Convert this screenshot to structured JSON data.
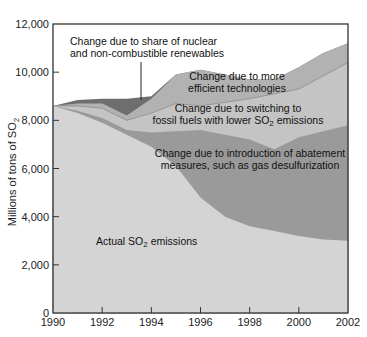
{
  "chart_data": {
    "type": "area",
    "stacked": true,
    "title": "",
    "xlabel": "",
    "ylabel": "Millions of tons of SO2",
    "xlim": [
      1990,
      2002
    ],
    "ylim": [
      0,
      12000
    ],
    "x_ticks": [
      1990,
      1992,
      1994,
      1996,
      1998,
      2000,
      2002
    ],
    "y_ticks": [
      0,
      2000,
      4000,
      6000,
      8000,
      10000,
      12000
    ],
    "y_tick_labels": [
      "0",
      "2,000",
      "4,000",
      "6,000",
      "8,000",
      "10,000",
      "12,000"
    ],
    "x_tick_labels": [
      "1990",
      "1992",
      "1994",
      "1996",
      "1998",
      "2000",
      "2002"
    ],
    "grid": false,
    "x": [
      1990,
      1991,
      1992,
      1993,
      1994,
      1995,
      1996,
      1997,
      1998,
      1999,
      2000,
      2001,
      2002
    ],
    "series": [
      {
        "name": "Actual SO2 emissions",
        "color": "#d4d4d4",
        "cumulative_top": [
          8600,
          8300,
          7900,
          7400,
          6900,
          6100,
          4800,
          4000,
          3600,
          3400,
          3200,
          3050,
          3000
        ]
      },
      {
        "name": "Change due to introduction of abatement measures, such as gas desulfurization",
        "color": "#9a9a9a",
        "cumulative_top": [
          8600,
          8400,
          8100,
          7600,
          7500,
          7550,
          7600,
          7400,
          7200,
          6800,
          7300,
          7550,
          7800
        ]
      },
      {
        "name": "Change due to switching to fossil fuels with lower SO2 emissions",
        "color": "#c4c4c4",
        "cumulative_top": [
          8600,
          8600,
          8500,
          8000,
          8300,
          8700,
          8600,
          8750,
          8900,
          9100,
          9300,
          9850,
          10400
        ]
      },
      {
        "name": "Change due to more efficient technologies",
        "color": "#b2b2b2",
        "cumulative_top": [
          8600,
          8700,
          8700,
          8200,
          8900,
          9900,
          10100,
          9900,
          9700,
          9700,
          10200,
          10800,
          11200
        ]
      },
      {
        "name": "Change due to share of nuclear and non-combustible renewables",
        "color": "#6e6e6e",
        "cumulative_top": [
          8600,
          8850,
          8900,
          8900,
          9000,
          9900,
          10100,
          9900,
          9700,
          9700,
          10200,
          10800,
          11200
        ]
      }
    ],
    "annotations": [
      {
        "text_lines": [
          "Change due to share of nuclear",
          "and non-combustible renewables"
        ],
        "x": 1993.6,
        "y": 11200,
        "leader_line_to": [
          1993.6,
          8800
        ]
      },
      {
        "text_lines": [
          "Change due to more",
          "efficient technologies"
        ],
        "x": 1998.2,
        "y": 9800
      },
      {
        "text_lines": [
          "Change due to switching to",
          "fossil fuels with lower SO2 emissions"
        ],
        "x": 1998.2,
        "y": 8700
      },
      {
        "text_lines": [
          "Change due to introduction of abatement",
          "measures, such as gas desulfurization"
        ],
        "x": 1998.6,
        "y": 7200
      },
      {
        "text_lines": [
          "Actual SO2 emissions"
        ],
        "x": 1994.5,
        "y": 3600
      }
    ]
  },
  "labels": {
    "ylabel_main": "Millions of tons of SO",
    "ylabel_sub": "2",
    "nuclear_line1": "Change due to share of nuclear",
    "nuclear_line2": "and non-combustible renewables",
    "efficient_line1": "Change due to more",
    "efficient_line2": "efficient technologies",
    "switch_line1": "Change due to switching to",
    "switch_line2a": "fossil fuels with lower SO",
    "switch_line2b": "2",
    "switch_line2c": " emissions",
    "abate_line1": "Change due to introduction of abatement",
    "abate_line2": "measures, such as gas desulfurization",
    "actual_a": "Actual SO",
    "actual_b": "2",
    "actual_c": " emissions"
  }
}
